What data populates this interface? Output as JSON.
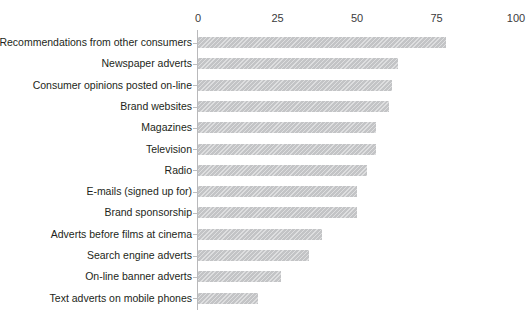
{
  "artifact": {
    "top_fragment": " "
  },
  "chart_data": {
    "type": "bar",
    "orientation": "horizontal",
    "title": "",
    "subtitle": "",
    "xlabel": "",
    "ylabel": "",
    "xlim": [
      0,
      100
    ],
    "ylim": null,
    "grid": false,
    "legend": null,
    "legend_position": "none",
    "bar_color": "#c3c4c6",
    "axis_color": "#b9b9bb",
    "text_color": "#231f20",
    "tick_labels": [
      "0",
      "25",
      "50",
      "75",
      "100"
    ],
    "ticks": [
      0,
      25,
      50,
      75,
      100
    ],
    "categories": [
      "Recommendations from other consumers",
      "Newspaper adverts",
      "Consumer opinions posted on-line",
      "Brand websites",
      "Magazines",
      "Television",
      "Radio",
      "E-mails (signed up for)",
      "Brand sponsorship",
      "Adverts before films at cinema",
      "Search engine adverts",
      "On-line banner adverts",
      "Text adverts on mobile phones"
    ],
    "values": [
      78,
      63,
      61,
      60,
      56,
      56,
      53,
      50,
      50,
      39,
      35,
      26,
      19
    ]
  }
}
